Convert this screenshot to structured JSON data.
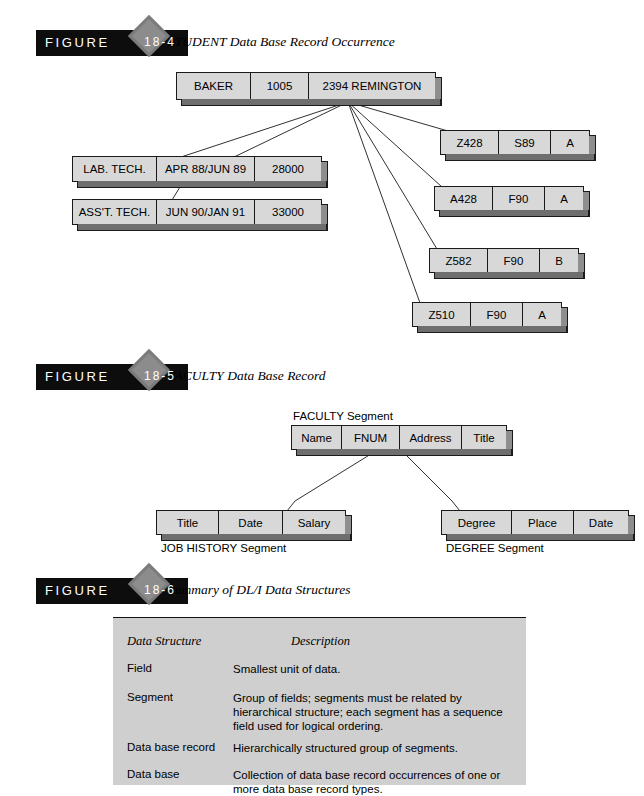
{
  "figures": [
    {
      "id": "fig-18-4",
      "label_word": "FIGURE",
      "label_number": "18-4",
      "caption": "STUDENT Data Base Record Occurrence",
      "root": {
        "cells": [
          "BAKER",
          "1005",
          "2394 REMINGTON"
        ]
      },
      "job_history": [
        {
          "cells": [
            "LAB. TECH.",
            "APR 88/JUN 89",
            "28000"
          ]
        },
        {
          "cells": [
            "ASS'T. TECH.",
            "JUN 90/JAN 91",
            "33000"
          ]
        }
      ],
      "courses": [
        {
          "cells": [
            "Z428",
            "S89",
            "A"
          ]
        },
        {
          "cells": [
            "A428",
            "F90",
            "A"
          ]
        },
        {
          "cells": [
            "Z582",
            "F90",
            "B"
          ]
        },
        {
          "cells": [
            "Z510",
            "F90",
            "A"
          ]
        }
      ]
    },
    {
      "id": "fig-18-5",
      "label_word": "FIGURE",
      "label_number": "18-5",
      "caption": "FACULTY Data Base Record",
      "parent_label": "FACULTY Segment",
      "parent": {
        "cells": [
          "Name",
          "FNUM",
          "Address",
          "Title"
        ]
      },
      "left_child_label": "JOB HISTORY Segment",
      "left_child": {
        "cells": [
          "Title",
          "Date",
          "Salary"
        ]
      },
      "right_child_label": "DEGREE Segment",
      "right_child": {
        "cells": [
          "Degree",
          "Place",
          "Date"
        ]
      }
    },
    {
      "id": "fig-18-6",
      "label_word": "FIGURE",
      "label_number": "18-6",
      "caption": "Summary of DL/I Data Structures"
    }
  ],
  "summary_table": {
    "headers": [
      "Data Structure",
      "Description"
    ],
    "rows": [
      {
        "structure": "Field",
        "description": "Smallest unit of data."
      },
      {
        "structure": "Segment",
        "description": "Group of fields; segments must be related by hierarchical structure; each segment has a sequence field used for logical ordering."
      },
      {
        "structure": "Data base record",
        "description": "Hierarchically structured group of segments."
      },
      {
        "structure": "Data base",
        "description": "Collection of data base record occurrences of one or more data base record types."
      }
    ]
  },
  "colors": {
    "bar": "#0d0d0d",
    "diamond": "#8c8c8c",
    "box_face": "#d8d8d8",
    "box_shadow": "#6e6e6e",
    "table_bg": "#cfcfcf"
  }
}
